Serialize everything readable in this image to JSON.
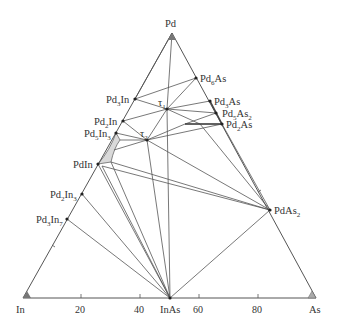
{
  "diagram": {
    "type": "ternary-phase-diagram",
    "vertices": {
      "top": {
        "label": "Pd",
        "x": 172,
        "y": 33
      },
      "left": {
        "label": "In",
        "x": 23,
        "y": 298
      },
      "right": {
        "label": "As",
        "x": 316,
        "y": 298
      }
    },
    "axis_ticks": [
      {
        "label": "20",
        "x": 81
      },
      {
        "label": "40",
        "x": 140
      },
      {
        "label": "60",
        "x": 199
      },
      {
        "label": "80",
        "x": 258
      }
    ],
    "phases": [
      {
        "id": "Pd6As",
        "base": "Pd",
        "sub1": "6",
        "mid": "As",
        "sub2": "",
        "x": 196,
        "y": 78
      },
      {
        "id": "Pd3As",
        "base": "Pd",
        "sub1": "3",
        "mid": "As",
        "sub2": "",
        "x": 210,
        "y": 101
      },
      {
        "id": "Pd5As2",
        "base": "Pd",
        "sub1": "5",
        "mid": "As",
        "sub2": "2",
        "x": 216,
        "y": 113
      },
      {
        "id": "Pd2As",
        "base": "Pd",
        "sub1": "2",
        "mid": "As",
        "sub2": "",
        "x": 222,
        "y": 124
      },
      {
        "id": "Pd3In",
        "base": "Pd",
        "sub1": "3",
        "mid": "In",
        "sub2": "",
        "x": 135,
        "y": 99
      },
      {
        "id": "Pd2In",
        "base": "Pd",
        "sub1": "2",
        "mid": "In",
        "sub2": "",
        "x": 123,
        "y": 121
      },
      {
        "id": "Pd5In3",
        "base": "Pd",
        "sub1": "5",
        "mid": "In",
        "sub2": "3",
        "x": 116,
        "y": 133
      },
      {
        "id": "PdIn",
        "base": "PdIn",
        "sub1": "",
        "mid": "",
        "sub2": "",
        "x": 98,
        "y": 164
      },
      {
        "id": "Pd2In3",
        "base": "Pd",
        "sub1": "2",
        "mid": "In",
        "sub2": "3",
        "x": 82,
        "y": 194
      },
      {
        "id": "Pd3In7",
        "base": "Pd",
        "sub1": "3",
        "mid": "In",
        "sub2": "7",
        "x": 67,
        "y": 219
      },
      {
        "id": "PdAs2",
        "base": "PdAs",
        "sub1": "",
        "mid": "",
        "sub2": "2",
        "x": 270,
        "y": 210
      },
      {
        "id": "InAs",
        "base": "InAs",
        "sub1": "",
        "mid": "",
        "sub2": "",
        "x": 170,
        "y": 298
      }
    ],
    "ternary_phases": [
      {
        "id": "tau1",
        "symbol": "τ",
        "sub": "1",
        "x": 167,
        "y": 109
      },
      {
        "id": "tau2",
        "symbol": "τ",
        "sub": "2",
        "x": 147,
        "y": 140
      }
    ],
    "colors": {
      "line": "#555555",
      "fill_region": "#d9d9d9"
    }
  }
}
